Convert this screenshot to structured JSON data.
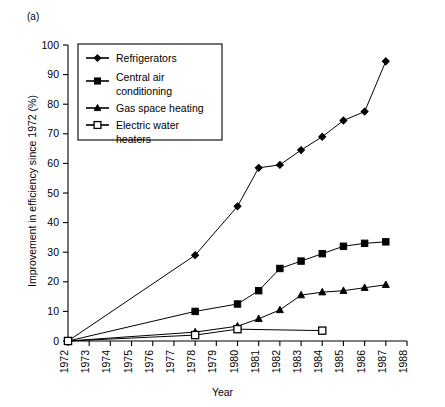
{
  "panel": {
    "label": "(a)"
  },
  "chart_data": {
    "type": "line",
    "title": "",
    "xlabel": "Year",
    "ylabel": "Improvement in efficiency since 1972 (%)",
    "xlim": [
      1972,
      1988
    ],
    "ylim": [
      0,
      100
    ],
    "xticks": [
      1972,
      1973,
      1974,
      1975,
      1976,
      1977,
      1978,
      1979,
      1980,
      1981,
      1982,
      1983,
      1984,
      1985,
      1986,
      1987,
      1988
    ],
    "xtick_labels": [
      "1972",
      "1973",
      "1974",
      "1975",
      "1976",
      "1977",
      "1978",
      "1979",
      "1980",
      "1981",
      "1982",
      "1983",
      "1984",
      "1985",
      "1986",
      "1987",
      "1988"
    ],
    "yticks": [
      0,
      10,
      20,
      30,
      40,
      50,
      60,
      70,
      80,
      90,
      100
    ],
    "ytick_labels": [
      "0",
      "10",
      "20",
      "30",
      "40",
      "50",
      "60",
      "70",
      "80",
      "90",
      "100"
    ],
    "grid": false,
    "legend_position": "upper left",
    "series": [
      {
        "name": "Refrigerators",
        "marker": "diamond",
        "x": [
          1972,
          1978,
          1980,
          1981,
          1982,
          1983,
          1984,
          1985,
          1986,
          1987
        ],
        "values": [
          0,
          29,
          45.5,
          58.5,
          59.5,
          64.5,
          69,
          74.5,
          77.5,
          94.5
        ]
      },
      {
        "name": "Central air conditioning",
        "marker": "square-filled",
        "x": [
          1972,
          1978,
          1980,
          1981,
          1982,
          1983,
          1984,
          1985,
          1986,
          1987
        ],
        "values": [
          0,
          10,
          12.5,
          17,
          24.5,
          27,
          29.5,
          32,
          33,
          33.5
        ]
      },
      {
        "name": "Gas space heating",
        "marker": "triangle",
        "x": [
          1972,
          1978,
          1980,
          1981,
          1982,
          1983,
          1984,
          1985,
          1986,
          1987
        ],
        "values": [
          0,
          3,
          5,
          7.5,
          10.5,
          15.5,
          16.5,
          17,
          18,
          19
        ]
      },
      {
        "name": "Electric water heaters",
        "marker": "square-open",
        "x": [
          1972,
          1978,
          1980,
          1984
        ],
        "values": [
          0,
          2,
          4,
          3.5
        ]
      }
    ]
  },
  "legend": {
    "entries": [
      {
        "label_line1": "Refrigerators",
        "label_line2": ""
      },
      {
        "label_line1": "Central air",
        "label_line2": "conditioning"
      },
      {
        "label_line1": "Gas space heating",
        "label_line2": ""
      },
      {
        "label_line1": "Electric water",
        "label_line2": "heaters"
      }
    ]
  }
}
